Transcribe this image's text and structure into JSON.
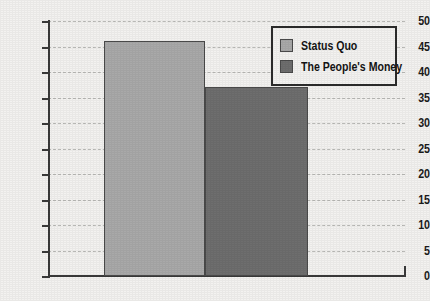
{
  "chart_data": {
    "type": "bar",
    "title": "",
    "subtitle": "",
    "xlabel": "",
    "ylabel": "",
    "categories": [
      ""
    ],
    "series": [
      {
        "name": "Status Quo",
        "values": [
          46
        ],
        "color": "#a9a9a9"
      },
      {
        "name": "The People's Money",
        "values": [
          37
        ],
        "color": "#6e6e6e"
      }
    ],
    "ylim": [
      0,
      50
    ],
    "ytick_step": 5,
    "ytick_labels": [
      "50",
      "45",
      "40",
      "35",
      "30",
      "25",
      "20",
      "15",
      "10",
      "5",
      "0"
    ],
    "ytick_values": [
      50,
      45,
      40,
      35,
      30,
      25,
      20,
      15,
      10,
      5,
      0
    ],
    "xtick_labels": [],
    "grid": true,
    "grid_style": "dashed",
    "grid_color": "#b9b9b6",
    "legend_position": "top-right",
    "background_color": "#f3f2f0",
    "axis_color": "#3a3a3a"
  },
  "legend": {
    "items": [
      {
        "label": "Status Quo",
        "color": "#a9a9a9"
      },
      {
        "label": "The People's Money",
        "color": "#6e6e6e"
      }
    ]
  }
}
